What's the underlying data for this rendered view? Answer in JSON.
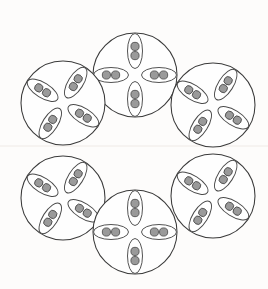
{
  "figure": {
    "title": "",
    "background_color": "#fdfcfb",
    "width": 268,
    "height": 289
  },
  "style": {
    "cell_stroke": "#3a3a3a",
    "cell_fill": "#fefefe",
    "pod_stroke": "#4a4a4a",
    "pod_fill": "#ffffff",
    "dot_fill": "#9a9a9a",
    "dot_stroke": "#4d4d4d",
    "seam_color": "#efeae6"
  },
  "geometry": {
    "cell_radius": 42,
    "pod_rx": 17.5,
    "pod_ry": 7.5,
    "pod_offset": 24,
    "dot_radius": 4.1,
    "dot_spacing": 9.2,
    "seam_y": 146
  },
  "cells": [
    {
      "id": "cell-top-center",
      "label": "top-center",
      "pattern": "cross",
      "cx": 135,
      "cy": 75,
      "r": 42,
      "pods": [
        {
          "id": "pod-n",
          "label": "north",
          "angle": -90,
          "dots": 2
        },
        {
          "id": "pod-e",
          "label": "east",
          "angle": 0,
          "dots": 2
        },
        {
          "id": "pod-s",
          "label": "south",
          "angle": 90,
          "dots": 2
        },
        {
          "id": "pod-w",
          "label": "west",
          "angle": 180,
          "dots": 2
        }
      ]
    },
    {
      "id": "cell-upper-left",
      "label": "upper-left",
      "pattern": "pinwheel",
      "cx": 63,
      "cy": 103,
      "r": 42,
      "pods": [
        {
          "id": "pod-ne",
          "label": "upper-right",
          "angle": -58,
          "dots": 2
        },
        {
          "id": "pod-se",
          "label": "lower-right",
          "angle": 32,
          "dots": 2
        },
        {
          "id": "pod-sw",
          "label": "lower-left",
          "angle": 122,
          "dots": 2
        },
        {
          "id": "pod-nw",
          "label": "upper-left",
          "angle": 212,
          "dots": 2
        }
      ]
    },
    {
      "id": "cell-upper-right",
      "label": "upper-right",
      "pattern": "pinwheel",
      "cx": 213,
      "cy": 105,
      "r": 42,
      "pods": [
        {
          "id": "pod-ne",
          "label": "upper-right",
          "angle": -58,
          "dots": 2
        },
        {
          "id": "pod-se",
          "label": "lower-right",
          "angle": 32,
          "dots": 2
        },
        {
          "id": "pod-sw",
          "label": "lower-left",
          "angle": 122,
          "dots": 2
        },
        {
          "id": "pod-nw",
          "label": "upper-left",
          "angle": 212,
          "dots": 2
        }
      ]
    },
    {
      "id": "cell-lower-left",
      "label": "lower-left",
      "pattern": "pinwheel",
      "cx": 63,
      "cy": 198,
      "r": 42,
      "pods": [
        {
          "id": "pod-ne",
          "label": "upper-right",
          "angle": -58,
          "dots": 2
        },
        {
          "id": "pod-se",
          "label": "lower-right",
          "angle": 32,
          "dots": 2
        },
        {
          "id": "pod-sw",
          "label": "lower-left",
          "angle": 122,
          "dots": 2
        },
        {
          "id": "pod-nw",
          "label": "upper-left",
          "angle": 212,
          "dots": 2
        }
      ]
    },
    {
      "id": "cell-lower-right",
      "label": "lower-right",
      "pattern": "pinwheel",
      "cx": 213,
      "cy": 196,
      "r": 42,
      "pods": [
        {
          "id": "pod-ne",
          "label": "upper-right",
          "angle": -58,
          "dots": 2
        },
        {
          "id": "pod-se",
          "label": "lower-right",
          "angle": 32,
          "dots": 2
        },
        {
          "id": "pod-sw",
          "label": "lower-left",
          "angle": 122,
          "dots": 2
        },
        {
          "id": "pod-nw",
          "label": "upper-left",
          "angle": 212,
          "dots": 2
        }
      ]
    },
    {
      "id": "cell-bottom-center",
      "label": "bottom-center",
      "pattern": "cross",
      "cx": 135,
      "cy": 232,
      "r": 42,
      "pods": [
        {
          "id": "pod-n",
          "label": "north",
          "angle": -90,
          "dots": 2
        },
        {
          "id": "pod-e",
          "label": "east",
          "angle": 0,
          "dots": 2
        },
        {
          "id": "pod-s",
          "label": "south",
          "angle": 90,
          "dots": 2
        },
        {
          "id": "pod-w",
          "label": "west",
          "angle": 180,
          "dots": 2
        }
      ]
    }
  ]
}
